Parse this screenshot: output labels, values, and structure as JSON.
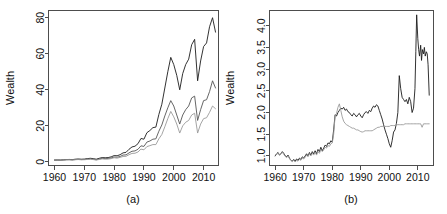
{
  "figure": {
    "background": "#ffffff",
    "panels": [
      "a",
      "b"
    ]
  },
  "chart_data": [
    {
      "id": "panel-a",
      "type": "line",
      "title": "",
      "panel_label": "(a)",
      "xlabel": "",
      "ylabel": "Wealth",
      "xlim": [
        1958.0,
        2015.0
      ],
      "ylim": [
        -2.0,
        84.0
      ],
      "xticks": [
        1960,
        1970,
        1980,
        1990,
        2000,
        2010
      ],
      "yticks": [
        0,
        20,
        40,
        60,
        80
      ],
      "xticklabels": [
        "1960",
        "1970",
        "1980",
        "1990",
        "2000",
        "2010"
      ],
      "yticklabels": [
        "0",
        "20",
        "40",
        "60",
        "80"
      ],
      "grid": false,
      "legend": "none",
      "series": [
        {
          "name": "strategy-1",
          "color": "#1c1c1c",
          "width": 0.9,
          "x": [
            1960,
            1961,
            1962,
            1963,
            1964,
            1965,
            1966,
            1967,
            1968,
            1969,
            1970,
            1971,
            1972,
            1973,
            1974,
            1975,
            1976,
            1977,
            1978,
            1979,
            1980,
            1981,
            1982,
            1983,
            1984,
            1985,
            1986,
            1987,
            1988,
            1989,
            1990,
            1991,
            1992,
            1993,
            1994,
            1995,
            1996,
            1997,
            1998,
            1999,
            2000,
            2001,
            2002,
            2003,
            2004,
            2005,
            2006,
            2007,
            2008,
            2009,
            2010,
            2011,
            2012,
            2013,
            2014
          ],
          "values": [
            1.0,
            1.05,
            1.0,
            1.15,
            1.3,
            1.35,
            1.25,
            1.5,
            1.6,
            1.5,
            1.55,
            1.8,
            2.0,
            1.8,
            1.5,
            2.0,
            2.4,
            2.3,
            2.4,
            2.8,
            3.5,
            3.4,
            4.0,
            5.0,
            5.3,
            7.0,
            8.3,
            8.7,
            10.1,
            13.0,
            12.6,
            16.2,
            17.4,
            19.0,
            19.3,
            26.3,
            32.0,
            41.0,
            50.0,
            58.0,
            54.0,
            48.0,
            40.0,
            49.0,
            54.0,
            57.0,
            65.0,
            68.0,
            45.0,
            56.0,
            64.0,
            66.0,
            75.0,
            80.0,
            72.0
          ]
        },
        {
          "name": "strategy-2",
          "color": "#555555",
          "width": 0.9,
          "x": [
            1960,
            1961,
            1962,
            1963,
            1964,
            1965,
            1966,
            1967,
            1968,
            1969,
            1970,
            1971,
            1972,
            1973,
            1974,
            1975,
            1976,
            1977,
            1978,
            1979,
            1980,
            1981,
            1982,
            1983,
            1984,
            1985,
            1986,
            1987,
            1988,
            1989,
            1990,
            1991,
            1992,
            1993,
            1994,
            1995,
            1996,
            1997,
            1998,
            1999,
            2000,
            2001,
            2002,
            2003,
            2004,
            2005,
            2006,
            2007,
            2008,
            2009,
            2010,
            2011,
            2012,
            2013,
            2014
          ],
          "values": [
            1.0,
            1.02,
            0.98,
            1.08,
            1.2,
            1.22,
            1.12,
            1.3,
            1.4,
            1.3,
            1.35,
            1.55,
            1.7,
            1.5,
            1.2,
            1.6,
            1.95,
            1.85,
            1.9,
            2.2,
            2.7,
            2.6,
            3.0,
            3.8,
            3.9,
            5.0,
            5.9,
            6.1,
            7.0,
            8.9,
            8.6,
            11.0,
            11.6,
            12.6,
            12.8,
            17.0,
            20.5,
            25.5,
            30.0,
            34.0,
            31.0,
            26.0,
            21.0,
            26.0,
            29.0,
            31.0,
            35.5,
            36.5,
            23.0,
            29.0,
            34.0,
            34.5,
            39.0,
            45.0,
            41.0
          ]
        },
        {
          "name": "benchmark",
          "color": "#9a9a9a",
          "width": 0.9,
          "x": [
            1960,
            1961,
            1962,
            1963,
            1964,
            1965,
            1966,
            1967,
            1968,
            1969,
            1970,
            1971,
            1972,
            1973,
            1974,
            1975,
            1976,
            1977,
            1978,
            1979,
            1980,
            1981,
            1982,
            1983,
            1984,
            1985,
            1986,
            1987,
            1988,
            1989,
            1990,
            1991,
            1992,
            1993,
            1994,
            1995,
            1996,
            1997,
            1998,
            1999,
            2000,
            2001,
            2002,
            2003,
            2004,
            2005,
            2006,
            2007,
            2008,
            2009,
            2010,
            2011,
            2012,
            2013,
            2014
          ],
          "values": [
            1.0,
            1.01,
            0.95,
            1.05,
            1.15,
            1.18,
            1.05,
            1.2,
            1.3,
            1.15,
            1.2,
            1.35,
            1.5,
            1.3,
            1.0,
            1.35,
            1.65,
            1.5,
            1.55,
            1.8,
            2.3,
            2.1,
            2.5,
            3.0,
            3.1,
            4.0,
            4.7,
            4.8,
            5.5,
            7.1,
            6.7,
            8.5,
            9.0,
            9.6,
            9.6,
            12.8,
            15.2,
            19.5,
            24.0,
            28.0,
            25.0,
            21.0,
            16.0,
            20.0,
            22.0,
            23.0,
            26.0,
            27.0,
            16.0,
            21.0,
            24.0,
            24.5,
            27.5,
            31.0,
            29.5
          ]
        }
      ]
    },
    {
      "id": "panel-b",
      "type": "line",
      "title": "",
      "panel_label": "(b)",
      "xlabel": "",
      "ylabel": "Wealth",
      "xlim": [
        1958.0,
        2015.5
      ],
      "ylim": [
        0.78,
        4.35
      ],
      "xticks": [
        1960,
        1970,
        1980,
        1990,
        2000,
        2010
      ],
      "yticks": [
        1.0,
        1.5,
        2.0,
        2.5,
        3.0,
        3.5,
        4.0
      ],
      "xticklabels": [
        "1960",
        "1970",
        "1980",
        "1990",
        "2000",
        "2010"
      ],
      "yticklabels": [
        "1.0",
        "1.5",
        "2.0",
        "2.5",
        "3.0",
        "3.5",
        "4.0"
      ],
      "grid": false,
      "legend": "none",
      "series": [
        {
          "name": "relative-wealth-dark",
          "color": "#1c1c1c",
          "width": 0.9,
          "x": [
            1960.0,
            1960.5,
            1961.0,
            1961.5,
            1962.0,
            1962.5,
            1963.0,
            1963.5,
            1964.0,
            1964.5,
            1965.0,
            1965.5,
            1966.0,
            1966.5,
            1967.0,
            1967.5,
            1968.0,
            1968.5,
            1969.0,
            1969.5,
            1970.0,
            1970.5,
            1971.0,
            1971.5,
            1972.0,
            1972.5,
            1973.0,
            1973.5,
            1974.0,
            1974.5,
            1975.0,
            1975.5,
            1976.0,
            1976.5,
            1977.0,
            1977.5,
            1978.0,
            1978.5,
            1979.0,
            1979.5,
            1980.0,
            1980.5,
            1981.0,
            1981.5,
            1982.0,
            1982.5,
            1983.0,
            1983.5,
            1984.0,
            1984.5,
            1985.0,
            1985.5,
            1986.0,
            1986.5,
            1987.0,
            1987.5,
            1988.0,
            1988.5,
            1989.0,
            1989.5,
            1990.0,
            1990.5,
            1991.0,
            1991.5,
            1992.0,
            1992.5,
            1993.0,
            1993.5,
            1994.0,
            1994.5,
            1995.0,
            1995.5,
            1996.0,
            1996.5,
            1997.0,
            1997.5,
            1998.0,
            1998.5,
            1999.0,
            1999.5,
            2000.0,
            2000.5,
            2001.0,
            2001.5,
            2002.0,
            2002.5,
            2003.0,
            2003.5,
            2004.0,
            2004.5,
            2005.0,
            2005.5,
            2006.0,
            2006.5,
            2007.0,
            2007.5,
            2008.0,
            2008.5,
            2009.0,
            2009.3,
            2009.6,
            2010.0,
            2010.3,
            2010.6,
            2011.0,
            2011.3,
            2011.6,
            2012.0,
            2012.3,
            2012.6,
            2013.0,
            2013.3,
            2013.6,
            2014.0
          ],
          "values": [
            1.0,
            1.05,
            1.08,
            1.02,
            1.05,
            1.1,
            1.06,
            1.0,
            0.98,
            1.02,
            0.95,
            0.9,
            0.88,
            0.92,
            0.88,
            0.93,
            0.9,
            0.95,
            0.92,
            0.98,
            0.95,
            1.0,
            1.05,
            1.0,
            1.08,
            1.02,
            1.1,
            1.05,
            1.12,
            1.05,
            1.15,
            1.1,
            1.2,
            1.12,
            1.18,
            1.25,
            1.22,
            1.3,
            1.28,
            1.35,
            1.32,
            1.6,
            1.95,
            1.92,
            2.0,
            2.05,
            2.1,
            2.08,
            2.12,
            2.05,
            2.08,
            2.02,
            2.0,
            1.95,
            1.92,
            1.98,
            1.95,
            1.9,
            1.95,
            1.98,
            1.92,
            1.88,
            1.95,
            2.0,
            2.02,
            1.98,
            2.05,
            2.02,
            2.1,
            2.15,
            2.12,
            2.18,
            2.15,
            2.05,
            1.95,
            1.85,
            1.72,
            1.6,
            1.5,
            1.4,
            1.28,
            1.2,
            1.35,
            1.55,
            1.6,
            1.75,
            2.0,
            2.85,
            2.55,
            2.35,
            2.3,
            2.25,
            2.3,
            2.2,
            2.35,
            2.25,
            2.0,
            2.1,
            2.55,
            3.4,
            4.25,
            3.7,
            3.45,
            3.3,
            3.55,
            3.2,
            3.45,
            3.35,
            3.5,
            3.3,
            3.4,
            3.35,
            3.1,
            2.4
          ]
        },
        {
          "name": "relative-wealth-light",
          "color": "#9a9a9a",
          "width": 0.9,
          "x": [
            1960.0,
            1960.5,
            1961.0,
            1961.5,
            1962.0,
            1962.5,
            1963.0,
            1963.5,
            1964.0,
            1964.5,
            1965.0,
            1965.5,
            1966.0,
            1966.5,
            1967.0,
            1967.5,
            1968.0,
            1968.5,
            1969.0,
            1969.5,
            1970.0,
            1970.5,
            1971.0,
            1971.5,
            1972.0,
            1972.5,
            1973.0,
            1973.5,
            1974.0,
            1974.5,
            1975.0,
            1975.5,
            1976.0,
            1976.5,
            1977.0,
            1977.5,
            1978.0,
            1978.5,
            1979.0,
            1979.5,
            1980.0,
            1980.5,
            1981.0,
            1981.5,
            1982.0,
            1982.5,
            1983.0,
            1983.5,
            1984.0,
            1984.5,
            1985.0,
            1985.5,
            1986.0,
            1986.5,
            1987.0,
            1987.5,
            1988.0,
            1988.5,
            1989.0,
            1989.5,
            1990.0,
            1990.5,
            1991.0,
            1991.5,
            1992.0,
            1992.5,
            1993.0,
            1993.5,
            1994.0,
            1994.5,
            1995.0,
            1995.5,
            1996.0,
            1996.5,
            1997.0,
            1997.5,
            1998.0,
            1998.5,
            1999.0,
            1999.5,
            2000.0,
            2000.5,
            2001.0,
            2001.5,
            2002.0,
            2002.5,
            2003.0,
            2003.5,
            2004.0,
            2004.5,
            2005.0,
            2005.5,
            2006.0,
            2006.5,
            2007.0,
            2007.5,
            2008.0,
            2008.5,
            2009.0,
            2009.5,
            2010.0,
            2010.5,
            2011.0,
            2011.5,
            2012.0,
            2012.5,
            2013.0,
            2013.5,
            2014.0
          ],
          "values": [
            1.02,
            1.04,
            1.06,
            1.03,
            1.05,
            1.08,
            1.04,
            0.99,
            0.96,
            1.0,
            0.94,
            0.9,
            0.87,
            0.9,
            0.86,
            0.9,
            0.88,
            0.92,
            0.9,
            0.95,
            0.93,
            0.97,
            1.02,
            0.98,
            1.05,
            1.0,
            1.06,
            1.02,
            1.08,
            1.02,
            1.1,
            1.06,
            1.14,
            1.1,
            1.14,
            1.2,
            1.18,
            1.24,
            1.22,
            1.28,
            1.3,
            1.5,
            1.92,
            1.98,
            2.12,
            2.2,
            2.05,
            1.9,
            1.8,
            1.75,
            1.72,
            1.7,
            1.68,
            1.66,
            1.64,
            1.64,
            1.62,
            1.6,
            1.6,
            1.58,
            1.56,
            1.55,
            1.56,
            1.58,
            1.58,
            1.58,
            1.58,
            1.58,
            1.58,
            1.6,
            1.62,
            1.64,
            1.66,
            1.66,
            1.68,
            1.68,
            1.68,
            1.68,
            1.68,
            1.68,
            1.68,
            1.7,
            1.7,
            1.7,
            1.7,
            1.72,
            1.72,
            1.72,
            1.72,
            1.72,
            1.72,
            1.74,
            1.74,
            1.74,
            1.74,
            1.74,
            1.74,
            1.74,
            1.74,
            1.74,
            1.74,
            1.74,
            1.74,
            1.66,
            1.74,
            1.74,
            1.74,
            1.74,
            1.74
          ]
        }
      ]
    }
  ]
}
